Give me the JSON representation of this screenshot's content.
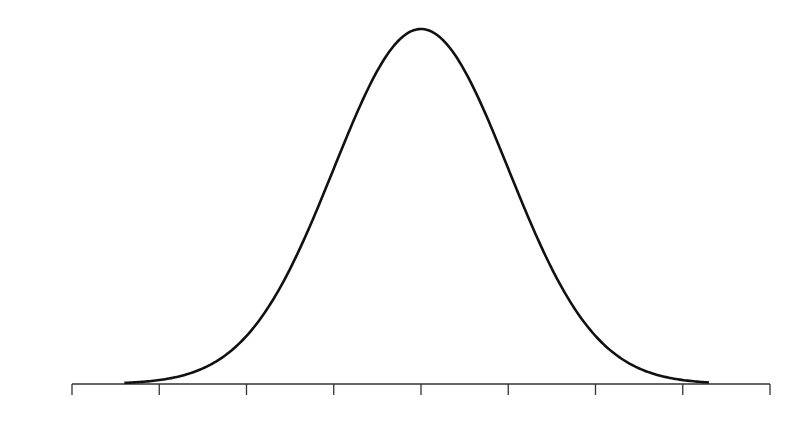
{
  "chart_data": {
    "type": "line",
    "title": "",
    "xlabel": "",
    "ylabel": "",
    "distribution": {
      "name": "normal",
      "mean": 0,
      "sd": 1
    },
    "x_ticks": [
      -4,
      -3,
      -2,
      -1,
      0,
      1,
      2,
      3,
      4
    ],
    "x_tick_labels": [],
    "xlim": [
      -4,
      4
    ],
    "curve_range": [
      -3.4,
      3.3
    ],
    "ylim": [
      0,
      0.4
    ],
    "grid": false,
    "legend": null,
    "series": [
      {
        "name": "density",
        "x": [
          -3.4,
          -3,
          -2.5,
          -2,
          -1.5,
          -1,
          -0.5,
          0,
          0.5,
          1,
          1.5,
          2,
          2.5,
          3,
          3.3
        ],
        "values": [
          0.001,
          0.004,
          0.018,
          0.054,
          0.13,
          0.242,
          0.352,
          0.399,
          0.352,
          0.242,
          0.13,
          0.054,
          0.018,
          0.004,
          0.002
        ]
      }
    ],
    "colors": {
      "curve": "#111111",
      "axis": "#333333",
      "background": "#ffffff"
    }
  }
}
